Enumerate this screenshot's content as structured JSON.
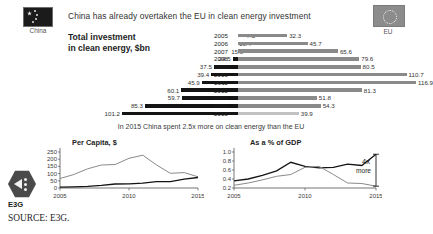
{
  "header": {
    "headline": "China has already overtaken the EU in clean energy investment",
    "china_flag_label": "China",
    "eu_flag_label": "EU",
    "china_flag_icon": "china-flag-icon",
    "eu_flag_icon": "eu-flag-icon"
  },
  "bar_block": {
    "title_line1": "Total investment",
    "title_line2": "in clean energy, $bn",
    "caption": "In 2015 China spent 2.5x more on clean energy than the EU"
  },
  "footer": {
    "logo_text": "E3G",
    "source": "SOURCE: E3G.",
    "logo_icon": "e3g-hex-logo-icon"
  },
  "colors": {
    "china_bar": "#141414",
    "eu_bar": "#8a8a8a",
    "eu_bar_last": "#c2c2c2",
    "text": "#1d1d1d",
    "background": "#ffffff"
  },
  "chart_data": [
    {
      "type": "bar",
      "subtype": "diverging-tornado",
      "title": "Total investment in clean energy, $bn",
      "xlabel": "",
      "ylabel": "",
      "categories": [
        "2005",
        "2006",
        "2007",
        "2008",
        "2009",
        "2010",
        "2011",
        "2012",
        "2013",
        "2014",
        "2015"
      ],
      "series": [
        {
          "name": "China",
          "side": "left",
          "color": "#141414",
          "values": [
            7.5,
            10.4,
            15.8,
            24.5,
            37.5,
            39.4,
            45.9,
            60.1,
            59.7,
            85.3,
            101.2
          ]
        },
        {
          "name": "EU",
          "side": "right",
          "color": "#8a8a8a",
          "values": [
            32.3,
            45.7,
            65.6,
            79.6,
            80.5,
            110.7,
            116.9,
            81.3,
            51.8,
            54.3,
            39.9
          ]
        }
      ],
      "value_labels": true,
      "grid": false,
      "legend_position": "top-flags",
      "units": "$bn",
      "xlim": [
        0,
        120
      ]
    },
    {
      "type": "line",
      "title": "Per Capita, $",
      "xlabel": "",
      "ylabel": "",
      "x": [
        "2005",
        "2006",
        "2007",
        "2008",
        "2009",
        "2010",
        "2011",
        "2012",
        "2013",
        "2014",
        "2015"
      ],
      "x_ticks": [
        "2005",
        "2010",
        "2015"
      ],
      "y_ticks": [
        0,
        50,
        100,
        150,
        200,
        250
      ],
      "ylim": [
        0,
        250
      ],
      "grid": false,
      "legend_position": "none",
      "series": [
        {
          "name": "EU",
          "color": "#8a8a8a",
          "values": [
            66,
            94,
            133,
            160,
            163,
            206,
            228,
            160,
            102,
            107,
            78
          ]
        },
        {
          "name": "China",
          "color": "#141414",
          "values": [
            6,
            8,
            12,
            18,
            28,
            29,
            34,
            44,
            44,
            62,
            73
          ]
        }
      ]
    },
    {
      "type": "line",
      "title": "As a % of GDP",
      "xlabel": "",
      "ylabel": "",
      "x": [
        "2005",
        "2006",
        "2007",
        "2008",
        "2009",
        "2010",
        "2011",
        "2012",
        "2013",
        "2014",
        "2015"
      ],
      "x_ticks": [
        "2005",
        "2010",
        "2015"
      ],
      "y_ticks": [
        0.2,
        0.4,
        0.6,
        0.8,
        1.0
      ],
      "ylim": [
        0.2,
        1.0
      ],
      "grid": false,
      "legend_position": "none",
      "annotation_line1": "4x",
      "annotation_line2": "more",
      "series": [
        {
          "name": "China",
          "color": "#141414",
          "values": [
            0.36,
            0.4,
            0.48,
            0.58,
            0.77,
            0.68,
            0.65,
            0.66,
            0.73,
            0.7,
            0.95
          ]
        },
        {
          "name": "EU",
          "color": "#8a8a8a",
          "values": [
            0.26,
            0.31,
            0.38,
            0.46,
            0.5,
            0.66,
            0.68,
            0.5,
            0.31,
            0.3,
            0.24
          ]
        }
      ]
    }
  ]
}
